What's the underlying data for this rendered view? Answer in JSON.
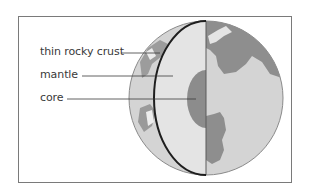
{
  "diagram": {
    "title": "",
    "labels": [
      {
        "id": "crust",
        "text": "thin rocky crust"
      },
      {
        "id": "mantle",
        "text": "mantle"
      },
      {
        "id": "core",
        "text": "core"
      }
    ],
    "colors": {
      "frame": "#7a7a7a",
      "globe_outline": "#8a8a8a",
      "ocean": "#d6d6d6",
      "land": "#8e8e8e",
      "mantle": "#e2e2e2",
      "core": "#8c8c8c",
      "crust_line": "#1e1e1e",
      "leader_line": "#3a3a3a"
    }
  }
}
